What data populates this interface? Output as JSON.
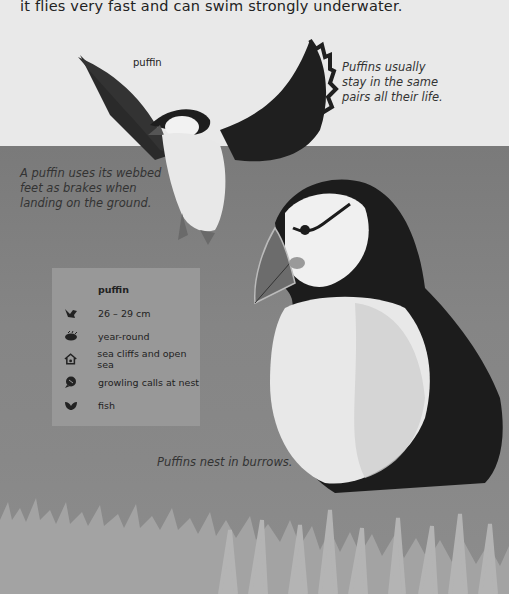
{
  "intro_text": "it flies very fast and can swim strongly underwater.",
  "flying_bird_label": "puffin",
  "facts": [
    "Puffins usually stay in the same pairs all their life.",
    "A puffin uses its webbed feet as brakes when landing on the ground.",
    "Puffins nest in burrows."
  ],
  "fact1_lines": [
    "Puffins usually",
    "stay in the same",
    "pairs all their life."
  ],
  "fact2_lines": [
    "A puffin uses its webbed",
    "feet as brakes when",
    "landing on the ground."
  ],
  "fact3_lines": [
    "Puffins nest in burrows."
  ],
  "info_card": {
    "title": "puffin",
    "rows": [
      {
        "icon": "bird-size-icon",
        "text": "26 – 29 cm"
      },
      {
        "icon": "season-icon",
        "text": "year-round"
      },
      {
        "icon": "habitat-house-icon",
        "text": "sea cliffs and open sea"
      },
      {
        "icon": "call-speech-icon",
        "text": "growling calls at nest"
      },
      {
        "icon": "food-leaf-icon",
        "text": "fish"
      }
    ]
  },
  "colors": {
    "sky": "#e9e9e9",
    "sea": "#808080",
    "card": "#989898",
    "bird_black": "#1e1e1e",
    "grass": "#a8a8a8"
  }
}
